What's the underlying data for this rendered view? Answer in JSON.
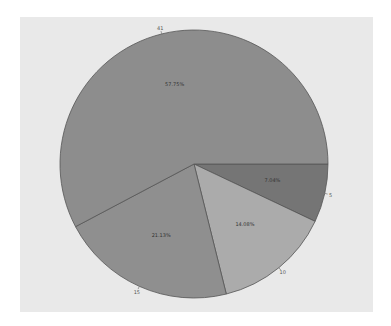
{
  "chart_data": {
    "type": "pie",
    "title": "",
    "categories": [
      "41",
      "5",
      "10",
      "15"
    ],
    "values": [
      41,
      5,
      10,
      15
    ],
    "percent_labels": [
      "57.75%",
      "7.04%",
      "14.08%",
      "21.13%"
    ],
    "colors": [
      "#8d8d8d",
      "#757575",
      "#ababab",
      "#8f8f8f"
    ],
    "start_angle_deg": 0,
    "direction": "clockwise",
    "order_from_start": [
      "5",
      "10",
      "15",
      "41"
    ],
    "legend": "none",
    "background": "#e9e9e9"
  }
}
